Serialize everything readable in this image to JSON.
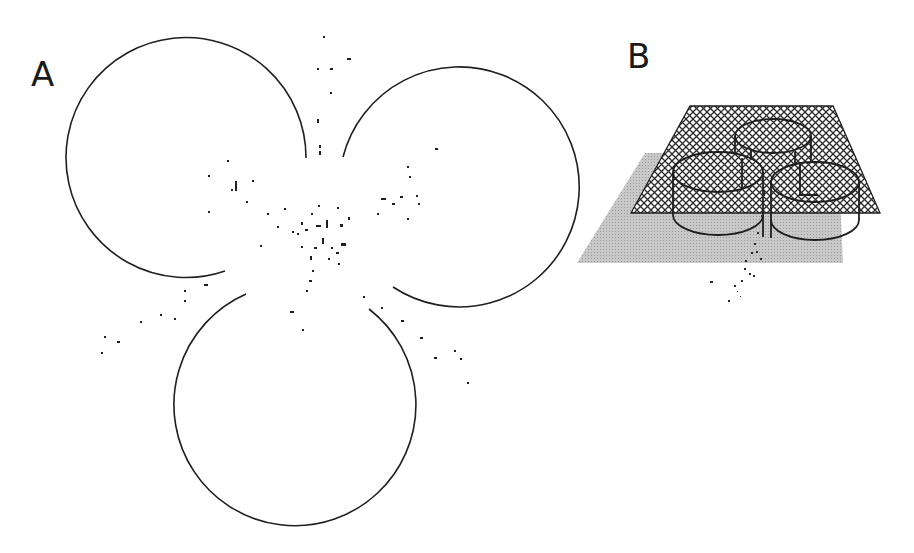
{
  "figure": {
    "panel_a": {
      "label": "A",
      "description": "Three open circles arranged in a trefoil with scattered particle traces concentrated at the center",
      "circles": [
        {
          "name": "upper-left",
          "cx": 187,
          "cy": 155,
          "r": 120
        },
        {
          "name": "upper-right",
          "cx": 455,
          "cy": 178,
          "r": 120
        },
        {
          "name": "bottom",
          "cx": 294,
          "cy": 405,
          "r": 121
        }
      ],
      "stroke_color": "#1f1f1f"
    },
    "panel_b": {
      "label": "B",
      "description": "3D perspective of a crosshatched plane with three cylindrical wells above a gray shaded plane, particle traces dropping below",
      "hatch_plane_color": "#2b2b2b",
      "shadow_plane_color": "#bdbdbd"
    },
    "colors": {
      "background": "#ffffff",
      "ink": "#1f1f1f",
      "gray_plane": "#c2c2c2"
    }
  }
}
